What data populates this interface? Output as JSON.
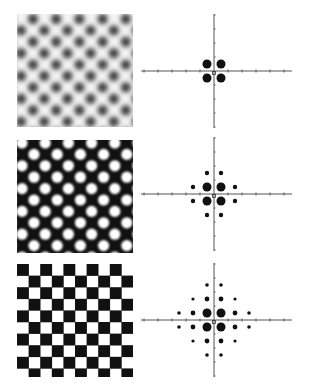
{
  "figure": {
    "rows": [
      {
        "pattern": {
          "type": "blurred-dots",
          "description": "Soft gray dots on white background, staggered lattice",
          "background": "#f4f4f4",
          "dot_color": "#3a3a3a",
          "blur": true
        },
        "spectrum": {
          "description": "Fourier spectrum: 4 first-order peaks",
          "peaks": [
            {
              "x": -1,
              "y": 1,
              "r": 4.5
            },
            {
              "x": 1,
              "y": 1,
              "r": 4.5
            },
            {
              "x": -1,
              "y": -1,
              "r": 4.5
            },
            {
              "x": 1,
              "y": -1,
              "r": 4.5
            }
          ]
        }
      },
      {
        "pattern": {
          "type": "sharp-dots",
          "description": "White dots on black background, staggered lattice",
          "background": "#111111",
          "dot_color": "#ffffff",
          "blur": false
        },
        "spectrum": {
          "description": "Fourier spectrum: first + higher order peaks",
          "peaks": [
            {
              "x": -1,
              "y": 1,
              "r": 4.5
            },
            {
              "x": 1,
              "y": 1,
              "r": 4.5
            },
            {
              "x": -1,
              "y": -1,
              "r": 4.5
            },
            {
              "x": 1,
              "y": -1,
              "r": 4.5
            },
            {
              "x": -1,
              "y": 3,
              "r": 2.2
            },
            {
              "x": 1,
              "y": 3,
              "r": 2.2
            },
            {
              "x": -1,
              "y": -3,
              "r": 2.2
            },
            {
              "x": 1,
              "y": -3,
              "r": 2.2
            },
            {
              "x": -3,
              "y": 1,
              "r": 2.2
            },
            {
              "x": 3,
              "y": 1,
              "r": 2.2
            },
            {
              "x": -3,
              "y": -1,
              "r": 2.2
            },
            {
              "x": 3,
              "y": -1,
              "r": 2.2
            }
          ]
        }
      },
      {
        "pattern": {
          "type": "checkerboard",
          "description": "Black and white checkerboard",
          "background": "#ffffff",
          "dot_color": "#111111",
          "blur": false
        },
        "spectrum": {
          "description": "Fourier spectrum: many odd-order peaks",
          "peaks": [
            {
              "x": -1,
              "y": 1,
              "r": 4.5
            },
            {
              "x": 1,
              "y": 1,
              "r": 4.5
            },
            {
              "x": -1,
              "y": -1,
              "r": 4.5
            },
            {
              "x": 1,
              "y": -1,
              "r": 4.5
            },
            {
              "x": -1,
              "y": 3,
              "r": 2.4
            },
            {
              "x": 1,
              "y": 3,
              "r": 2.4
            },
            {
              "x": -1,
              "y": -3,
              "r": 2.4
            },
            {
              "x": 1,
              "y": -3,
              "r": 2.4
            },
            {
              "x": -3,
              "y": 1,
              "r": 2.4
            },
            {
              "x": 3,
              "y": 1,
              "r": 2.4
            },
            {
              "x": -3,
              "y": -1,
              "r": 2.4
            },
            {
              "x": 3,
              "y": -1,
              "r": 2.4
            },
            {
              "x": -3,
              "y": 3,
              "r": 1.6
            },
            {
              "x": 3,
              "y": 3,
              "r": 1.6
            },
            {
              "x": -3,
              "y": -3,
              "r": 1.6
            },
            {
              "x": 3,
              "y": -3,
              "r": 1.6
            },
            {
              "x": -1,
              "y": 5,
              "r": 1.8
            },
            {
              "x": 1,
              "y": 5,
              "r": 1.8
            },
            {
              "x": -1,
              "y": -5,
              "r": 1.8
            },
            {
              "x": 1,
              "y": -5,
              "r": 1.8
            },
            {
              "x": -5,
              "y": 1,
              "r": 1.8
            },
            {
              "x": 5,
              "y": 1,
              "r": 1.8
            },
            {
              "x": -5,
              "y": -1,
              "r": 1.8
            },
            {
              "x": 5,
              "y": -1,
              "r": 1.8
            }
          ]
        }
      }
    ],
    "axis": {
      "color": "#555555",
      "tick_count_half": 5
    }
  }
}
